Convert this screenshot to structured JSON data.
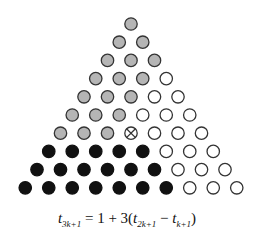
{
  "diagram": {
    "rows": 10,
    "radius": 6.2,
    "colors": {
      "gray": "#b5b5b5",
      "black": "#111111",
      "white": "#ffffff",
      "stroke": "#333333"
    },
    "row_pattern": [
      [
        "gray"
      ],
      [
        "gray",
        "gray"
      ],
      [
        "gray",
        "gray",
        "gray"
      ],
      [
        "gray",
        "gray",
        "gray",
        "white"
      ],
      [
        "gray",
        "gray",
        "gray",
        "white",
        "white"
      ],
      [
        "gray",
        "gray",
        "gray",
        "white",
        "white",
        "white"
      ],
      [
        "gray",
        "gray",
        "gray",
        "cross",
        "white",
        "white",
        "white"
      ],
      [
        "black",
        "black",
        "black",
        "black",
        "black",
        "white",
        "white",
        "white"
      ],
      [
        "black",
        "black",
        "black",
        "black",
        "black",
        "black",
        "white",
        "white",
        "white"
      ],
      [
        "black",
        "black",
        "black",
        "black",
        "black",
        "black",
        "black",
        "white",
        "white",
        "white"
      ]
    ],
    "legend_counts": {
      "gray": 21,
      "black": 18,
      "white": 15,
      "cross": 1
    }
  },
  "formula": {
    "lhs_var": "t",
    "lhs_sub": "3k+1",
    "equals": "=",
    "one": "1",
    "plus": "+",
    "three": "3(",
    "a_var": "t",
    "a_sub": "2k+1",
    "minus": "−",
    "b_var": "t",
    "b_sub": "k+1",
    "close": ")"
  }
}
